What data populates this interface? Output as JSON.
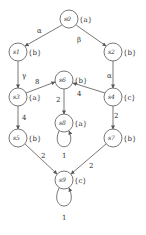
{
  "diagram": {
    "type": "weighted labeled transition graph",
    "nodes": [
      {
        "id": "s0",
        "label": "s0",
        "props": "{a}"
      },
      {
        "id": "s1",
        "label": "s1",
        "props": "{b}"
      },
      {
        "id": "s2",
        "label": "s2",
        "props": "{b}"
      },
      {
        "id": "s3",
        "label": "s3",
        "props": "{a}"
      },
      {
        "id": "s4",
        "label": "s4",
        "props": "{c}"
      },
      {
        "id": "s5",
        "label": "s5",
        "props": "{b}"
      },
      {
        "id": "s6",
        "label": "s6",
        "props": "{b}"
      },
      {
        "id": "s7",
        "label": "s7",
        "props": "{b}"
      },
      {
        "id": "s8",
        "label": "s8",
        "props": "{a}"
      },
      {
        "id": "s9",
        "label": "s9",
        "props": "{c}"
      }
    ],
    "edges": [
      {
        "from": "s0",
        "to": "s1",
        "label": "α"
      },
      {
        "from": "s0",
        "to": "s2",
        "label": "β"
      },
      {
        "from": "s1",
        "to": "s3",
        "label": "γ"
      },
      {
        "from": "s2",
        "to": "s4",
        "label": "α"
      },
      {
        "from": "s3",
        "to": "s6",
        "label": "8"
      },
      {
        "from": "s4",
        "to": "s6",
        "label": "4"
      },
      {
        "from": "s6",
        "to": "s8",
        "label": "2"
      },
      {
        "from": "s8",
        "to": "s8",
        "label": "1"
      },
      {
        "from": "s3",
        "to": "s5",
        "label": "4"
      },
      {
        "from": "s4",
        "to": "s7",
        "label": "2"
      },
      {
        "from": "s5",
        "to": "s9",
        "label": "2"
      },
      {
        "from": "s7",
        "to": "s9",
        "label": "2"
      },
      {
        "from": "s9",
        "to": "s9",
        "label": "1"
      }
    ]
  }
}
